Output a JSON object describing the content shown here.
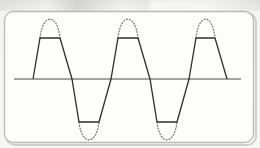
{
  "figure": {
    "kind": "waveform-diagram",
    "caption": "",
    "background_color": "#f4f4f2",
    "frame": {
      "stroke_color": "#b9b9b7",
      "fill_color": "#fdfdfc",
      "corner_radius": 9,
      "x": 4,
      "y": 11,
      "width": 250,
      "height": 132
    }
  },
  "axis": {
    "label": "",
    "color": "#a2a2a0",
    "y": 79,
    "x_start": 14,
    "x_end": 241,
    "thickness": 1.6
  },
  "series": {
    "clipped": {
      "name": "clipped-waveform",
      "style": "solid",
      "color": "#2f2f2f",
      "thickness": 1.3
    },
    "ideal": {
      "name": "ideal-sine-peaks",
      "style": "dotted",
      "color": "#7a7a78",
      "thickness": 1.3,
      "dot_pattern": "0.9 2.1"
    }
  },
  "chart_data": {
    "type": "line",
    "title": "",
    "subtitle": "",
    "xlabel": "",
    "ylabel": "",
    "grid": false,
    "legend": null,
    "annotations": [],
    "xlim": [
      0,
      260
    ],
    "ylim": [
      -1.55,
      1.55
    ],
    "zero_line_y_px": 79,
    "amplitude_ideal": 1.5,
    "clip_level": 1.0,
    "period_px": 77,
    "phase_zero_crossing_px": 33,
    "cycles": 3,
    "peak_px": {
      "ideal_top_y": 19,
      "clip_top_y": 38,
      "ideal_bottom_y": 140,
      "clip_bottom_y": 122
    },
    "peaks_x_px": [
      50,
      128,
      205
    ],
    "troughs_x_px": [
      89,
      167
    ],
    "series": [
      {
        "name": "clipped-waveform",
        "style": "solid",
        "description": "Sine wave symmetrically clipped (saturated) at plus and minus the clip level, forming flat trapezoid tops and bottoms",
        "points_px": [
          [
            33,
            79
          ],
          [
            40,
            38
          ],
          [
            60,
            38
          ],
          [
            72,
            79
          ],
          [
            79,
            122
          ],
          [
            99,
            122
          ],
          [
            111,
            79
          ],
          [
            118,
            38
          ],
          [
            138,
            38
          ],
          [
            150,
            79
          ],
          [
            157,
            122
          ],
          [
            177,
            122
          ],
          [
            189,
            79
          ],
          [
            196,
            38
          ],
          [
            215,
            38
          ],
          [
            227,
            79
          ]
        ]
      },
      {
        "name": "ideal-sine-peaks",
        "style": "dotted",
        "description": "Dotted arcs showing the unclipped sine peaks that were removed by clipping",
        "arcs_px": [
          {
            "x_start": 40,
            "x_end": 60,
            "apex_x": 50,
            "apex_y": 19,
            "base_y": 38,
            "direction": "up"
          },
          {
            "x_start": 118,
            "x_end": 138,
            "apex_x": 128,
            "apex_y": 19,
            "base_y": 38,
            "direction": "up"
          },
          {
            "x_start": 196,
            "x_end": 215,
            "apex_x": 205,
            "apex_y": 19,
            "base_y": 38,
            "direction": "up"
          },
          {
            "x_start": 79,
            "x_end": 99,
            "apex_x": 89,
            "apex_y": 140,
            "base_y": 122,
            "direction": "down"
          },
          {
            "x_start": 157,
            "x_end": 177,
            "apex_x": 167,
            "apex_y": 140,
            "base_y": 122,
            "direction": "down"
          }
        ]
      }
    ]
  }
}
